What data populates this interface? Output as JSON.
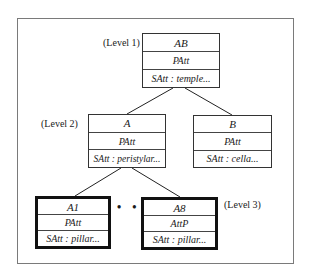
{
  "diagram": {
    "levels": [
      "(Level 1)",
      "(Level 2)",
      "(Level 3)"
    ],
    "nodes": {
      "AB": {
        "title": "AB",
        "p": "PAtt",
        "s": "SAtt : temple..."
      },
      "A": {
        "title": "A",
        "p": "PAtt",
        "s": "SAtt : peristylar..."
      },
      "B": {
        "title": "B",
        "p": "PAtt",
        "s": "SAtt : cella..."
      },
      "A1": {
        "title": "A1",
        "p": "PAtt",
        "s": "SAtt : pillar..."
      },
      "A8": {
        "title": "A8",
        "p": "AttP",
        "s": "SAtt : pillar..."
      }
    },
    "ellipsis": "• • •"
  }
}
